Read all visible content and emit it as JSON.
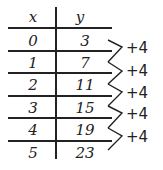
{
  "table": {
    "headers": {
      "x": "x",
      "y": "y"
    },
    "rows": [
      {
        "x": "0",
        "y": "3"
      },
      {
        "x": "1",
        "y": "7"
      },
      {
        "x": "2",
        "y": "11"
      },
      {
        "x": "3",
        "y": "15"
      },
      {
        "x": "4",
        "y": "19"
      },
      {
        "x": "5",
        "y": "23"
      }
    ]
  },
  "differences": [
    "+4",
    "+4",
    "+4",
    "+4",
    "+4"
  ]
}
